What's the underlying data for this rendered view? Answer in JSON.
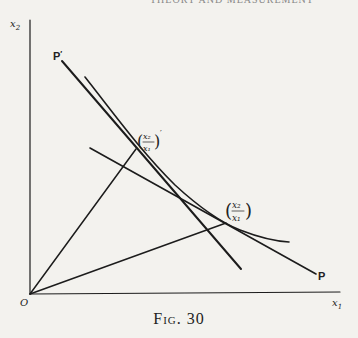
{
  "header_text": "THEORY AND MEASUREMENT",
  "axes": {
    "x_label": "x",
    "x_sub": "1",
    "y_label": "x",
    "y_sub": "2",
    "origin_label": "O"
  },
  "lines": {
    "steep_budget_line_label": "P",
    "steep_budget_line_prime": "′",
    "shallow_budget_line_label": "P"
  },
  "tangency_labels": {
    "upper": {
      "num": "x₂",
      "den": "x₁",
      "prime": "′"
    },
    "lower": {
      "num": "x₂",
      "den": "x₁"
    }
  },
  "caption": "Fig. 30"
}
